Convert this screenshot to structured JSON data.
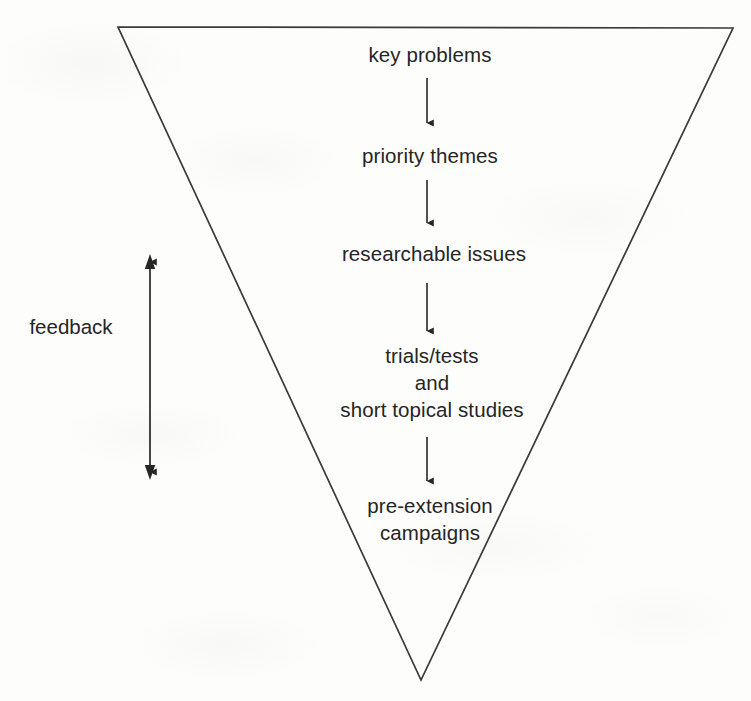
{
  "diagram": {
    "shape": {
      "name": "inverted-triangle",
      "stroke_color": "#3a3a3a",
      "fill_color": "none",
      "vertices": [
        [
          118,
          27
        ],
        [
          733,
          28
        ],
        [
          421,
          680
        ]
      ]
    },
    "background_color": "#fdfdfc",
    "text_color": "#252525",
    "flow": {
      "direction": "top-to-bottom",
      "arrow_color": "#262626",
      "stages": [
        {
          "id": "key-problems",
          "lines": [
            "key problems"
          ],
          "center_x": 430,
          "center_y": 55
        },
        {
          "id": "priority-themes",
          "lines": [
            "priority themes"
          ],
          "center_x": 430,
          "center_y": 156
        },
        {
          "id": "researchable-issues",
          "lines": [
            "researchable issues"
          ],
          "center_x": 434,
          "center_y": 254
        },
        {
          "id": "trials-tests",
          "lines": [
            "trials/tests",
            "and",
            "short topical studies"
          ],
          "center_x": 432,
          "center_y": 382
        },
        {
          "id": "pre-extension-campaigns",
          "lines": [
            "pre-extension",
            "campaigns"
          ],
          "center_x": 430,
          "center_y": 519
        }
      ],
      "connectors": [
        {
          "id": "arrow-key-problems-to-priority-themes",
          "x": 427,
          "y1": 78,
          "y2": 123
        },
        {
          "id": "arrow-priority-themes-to-researchable-issues",
          "x": 427,
          "y1": 180,
          "y2": 223
        },
        {
          "id": "arrow-researchable-issues-to-trials",
          "x": 427,
          "y1": 283,
          "y2": 331
        },
        {
          "id": "arrow-trials-to-pre-extension",
          "x": 427,
          "y1": 437,
          "y2": 481
        }
      ]
    },
    "feedback": {
      "label": "feedback",
      "arrow": {
        "id": "feedback-double-arrow",
        "x": 150,
        "y_top": 256,
        "y_bottom": 478,
        "heads": "both"
      }
    }
  }
}
